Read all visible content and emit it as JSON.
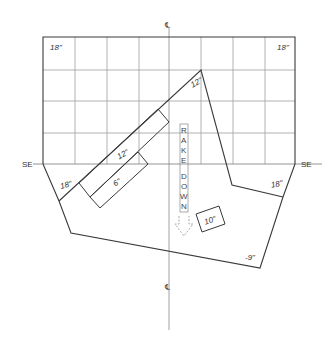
{
  "diagram": {
    "type": "roof-plan",
    "centerline_symbol": "℄",
    "grid": {
      "columns": 8,
      "rows": 4,
      "cell_px": 32
    },
    "labels": {
      "corner_top_left": "18\"",
      "corner_top_right": "18\"",
      "ridge_peak": "12\"",
      "strip_upper": "12\"",
      "strip_lower": "6\"",
      "left_lower": "18\"",
      "right_lower": "18\"",
      "box": "10\"",
      "bottom_right": "-9\"",
      "side_left": "SE",
      "side_right": "SE",
      "centerline_top": "℄",
      "centerline_bottom": "℄"
    },
    "rake_down": [
      "R",
      "A",
      "K",
      "E",
      "D",
      "O",
      "W",
      "N"
    ],
    "colors": {
      "outline": "#3a3a3a",
      "grid": "#9a9a9a",
      "background": "#ffffff"
    }
  }
}
